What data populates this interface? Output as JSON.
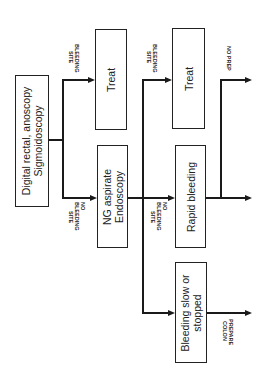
{
  "nodes": {
    "start": {
      "line1": "Digital rectal, anoscopy",
      "line2": "Sigmoidoscopy"
    },
    "treat1": {
      "label": "Treat"
    },
    "ng": {
      "line1": "NG aspirate",
      "line2": "Endoscopy"
    },
    "treat2": {
      "label": "Treat"
    },
    "rapid": {
      "label": "Rapid bleeding"
    },
    "slow": {
      "line1": "Bleeding slow or",
      "line2": "stopped"
    }
  },
  "edges": {
    "bleeding_site_1": {
      "line1": "BLEEDING",
      "line2": "SITE"
    },
    "no_bleeding_site_1": {
      "line1": "NO",
      "line2": "BLEEDING",
      "line3": "SITE"
    },
    "bleeding_site_2": {
      "line1": "BLEEDING",
      "line2": "SITE"
    },
    "no_bleeding_site_2": {
      "line1": "NO",
      "line2": "BLEEDING",
      "line3": "SITE"
    },
    "no_prep": {
      "label": "NO PREP"
    },
    "prepare_colon": {
      "line1": "PREPARE",
      "line2": "COLON"
    }
  }
}
